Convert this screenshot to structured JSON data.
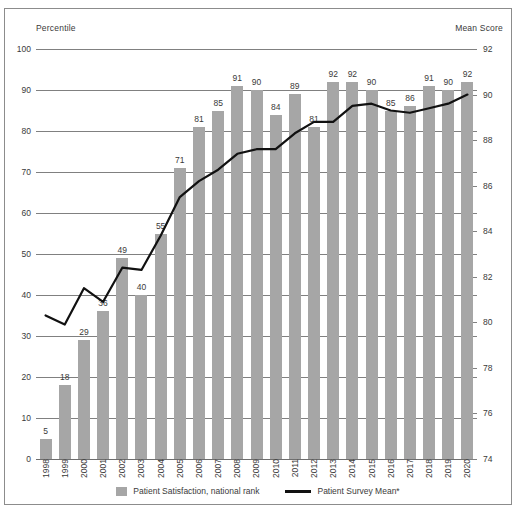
{
  "axis_captions": {
    "left": "Percentile",
    "right": "Mean Score"
  },
  "legend": {
    "bar_label": "Patient Satisfaction, national rank",
    "line_label": "Patient Survey Mean*"
  },
  "chart_data": {
    "type": "bar",
    "title": "",
    "subtitle": "",
    "xlabel": "",
    "ylabel": "Percentile",
    "y2label": "Mean Score",
    "ylim": [
      0,
      100
    ],
    "y2lim": [
      74,
      92
    ],
    "yticks": [
      0,
      10,
      20,
      30,
      40,
      50,
      60,
      70,
      80,
      90,
      100
    ],
    "y2ticks": [
      74,
      76,
      78,
      80,
      82,
      84,
      86,
      88,
      90,
      92
    ],
    "grid": true,
    "legend_position": "bottom",
    "categories": [
      "1998",
      "1999",
      "2000",
      "2001",
      "2002",
      "2003",
      "2004",
      "2005",
      "2006",
      "2007",
      "2008",
      "2009",
      "2010",
      "2011",
      "2012",
      "2013",
      "2014",
      "2015",
      "2016",
      "2017",
      "2018",
      "2019",
      "2020"
    ],
    "series": [
      {
        "name": "Patient Satisfaction, national rank",
        "type": "bar",
        "axis": "left",
        "color": "#a6a6a6",
        "values": [
          5,
          18,
          29,
          36,
          49,
          40,
          55,
          71,
          81,
          85,
          91,
          90,
          84,
          89,
          81,
          92,
          92,
          90,
          85,
          86,
          91,
          90,
          92
        ],
        "labels": [
          "5",
          "18",
          "29",
          "36",
          "49",
          "40",
          "55",
          "71",
          "81",
          "85",
          "91",
          "90",
          "84",
          "89",
          "81",
          "92",
          "92",
          "90",
          "85",
          "86",
          "91",
          "90",
          "92"
        ]
      },
      {
        "name": "Patient Survey Mean*",
        "type": "line",
        "axis": "right",
        "color": "#111111",
        "values": [
          80.3,
          79.9,
          81.5,
          80.9,
          82.4,
          82.3,
          83.8,
          85.5,
          86.2,
          86.7,
          87.4,
          87.6,
          87.6,
          88.3,
          88.8,
          88.8,
          89.5,
          89.6,
          89.3,
          89.2,
          89.4,
          89.6,
          90.0
        ]
      }
    ]
  }
}
